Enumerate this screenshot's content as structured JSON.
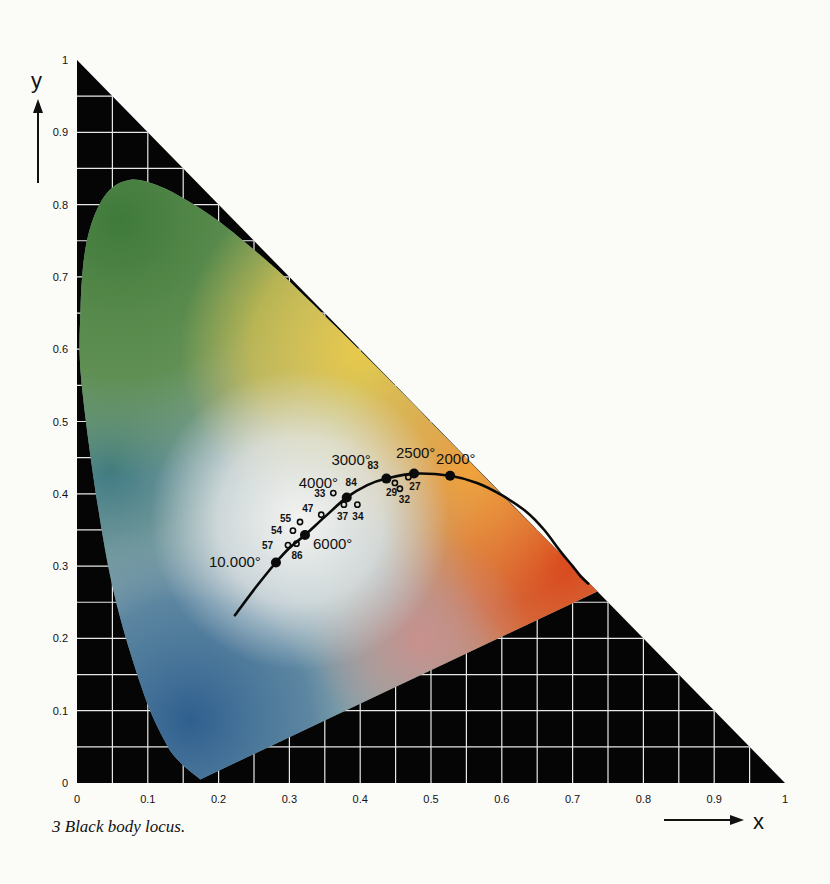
{
  "chart_data": {
    "type": "scatter",
    "title": "Black body locus",
    "caption": "3  Black body locus.",
    "xlabel": "x",
    "ylabel": "y",
    "xlim": [
      0,
      1
    ],
    "ylim": [
      0,
      1
    ],
    "grid": true,
    "grid_step": 0.05,
    "x_ticks": [
      "0",
      "0.1",
      "0.2",
      "0.3",
      "0.4",
      "0.5",
      "0.6",
      "0.7",
      "0.8",
      "0.9",
      "1"
    ],
    "y_ticks": [
      "0",
      "0.1",
      "0.2",
      "0.3",
      "0.4",
      "0.5",
      "0.6",
      "0.7",
      "0.8",
      "0.9",
      "1"
    ],
    "background_region": "triangle x+y<=1, black with white grid",
    "spectral_locus": [
      [
        0.174,
        0.005
      ],
      [
        0.144,
        0.03
      ],
      [
        0.124,
        0.058
      ],
      [
        0.091,
        0.133
      ],
      [
        0.045,
        0.295
      ],
      [
        0.008,
        0.538
      ],
      [
        0.005,
        0.655
      ],
      [
        0.014,
        0.75
      ],
      [
        0.039,
        0.812
      ],
      [
        0.074,
        0.834
      ],
      [
        0.115,
        0.826
      ],
      [
        0.155,
        0.806
      ],
      [
        0.193,
        0.782
      ],
      [
        0.23,
        0.754
      ],
      [
        0.266,
        0.724
      ],
      [
        0.302,
        0.692
      ],
      [
        0.373,
        0.624
      ],
      [
        0.444,
        0.555
      ],
      [
        0.512,
        0.487
      ],
      [
        0.575,
        0.424
      ],
      [
        0.627,
        0.372
      ],
      [
        0.666,
        0.334
      ],
      [
        0.692,
        0.308
      ],
      [
        0.735,
        0.265
      ]
    ],
    "planckian_locus": [
      [
        0.223,
        0.232
      ],
      [
        0.252,
        0.27
      ],
      [
        0.281,
        0.305
      ],
      [
        0.3,
        0.325
      ],
      [
        0.322,
        0.343
      ],
      [
        0.35,
        0.368
      ],
      [
        0.381,
        0.395
      ],
      [
        0.41,
        0.412
      ],
      [
        0.437,
        0.421
      ],
      [
        0.476,
        0.428
      ],
      [
        0.527,
        0.425
      ],
      [
        0.565,
        0.415
      ],
      [
        0.6,
        0.398
      ],
      [
        0.635,
        0.375
      ],
      [
        0.66,
        0.35
      ],
      [
        0.683,
        0.32
      ],
      [
        0.7,
        0.3
      ],
      [
        0.712,
        0.285
      ],
      [
        0.722,
        0.276
      ]
    ],
    "temperature_points": [
      {
        "label": "10.000°",
        "x": 0.281,
        "y": 0.305
      },
      {
        "label": "6000°",
        "x": 0.322,
        "y": 0.343
      },
      {
        "label": "4000°",
        "x": 0.381,
        "y": 0.395
      },
      {
        "label": "3000°",
        "x": 0.437,
        "y": 0.421
      },
      {
        "label": "2500°",
        "x": 0.476,
        "y": 0.428
      },
      {
        "label": "2000°",
        "x": 0.527,
        "y": 0.425
      }
    ],
    "sample_points": [
      {
        "label": "57",
        "x": 0.298,
        "y": 0.329
      },
      {
        "label": "86",
        "x": 0.31,
        "y": 0.331
      },
      {
        "label": "54",
        "x": 0.305,
        "y": 0.349
      },
      {
        "label": "55",
        "x": 0.315,
        "y": 0.361
      },
      {
        "label": "47",
        "x": 0.345,
        "y": 0.371
      },
      {
        "label": "33",
        "x": 0.362,
        "y": 0.401
      },
      {
        "label": "84",
        "x": 0.385,
        "y": 0.401
      },
      {
        "label": "37",
        "x": 0.377,
        "y": 0.385
      },
      {
        "label": "34",
        "x": 0.396,
        "y": 0.385
      },
      {
        "label": "83",
        "x": 0.433,
        "y": 0.423
      },
      {
        "label": "29",
        "x": 0.449,
        "y": 0.415
      },
      {
        "label": "32",
        "x": 0.456,
        "y": 0.407
      },
      {
        "label": "27",
        "x": 0.468,
        "y": 0.423
      }
    ]
  },
  "labels": {
    "y_axis": "y",
    "x_axis": "x",
    "caption": "3  Black body locus."
  }
}
